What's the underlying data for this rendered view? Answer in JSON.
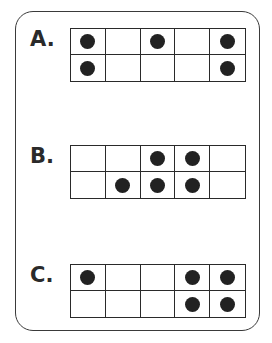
{
  "colors": {
    "frame": "#3a3a3a",
    "dot": "#222222",
    "background": "#ffffff"
  },
  "frames": [
    {
      "label": "A.",
      "rows": [
        [
          1,
          0,
          1,
          0,
          1
        ],
        [
          1,
          0,
          0,
          0,
          1
        ]
      ],
      "count": 5
    },
    {
      "label": "B.",
      "rows": [
        [
          0,
          0,
          1,
          1,
          0
        ],
        [
          0,
          1,
          1,
          1,
          0
        ]
      ],
      "count": 5
    },
    {
      "label": "C.",
      "rows": [
        [
          1,
          0,
          0,
          1,
          1
        ],
        [
          0,
          0,
          0,
          1,
          1
        ]
      ],
      "count": 5
    }
  ]
}
